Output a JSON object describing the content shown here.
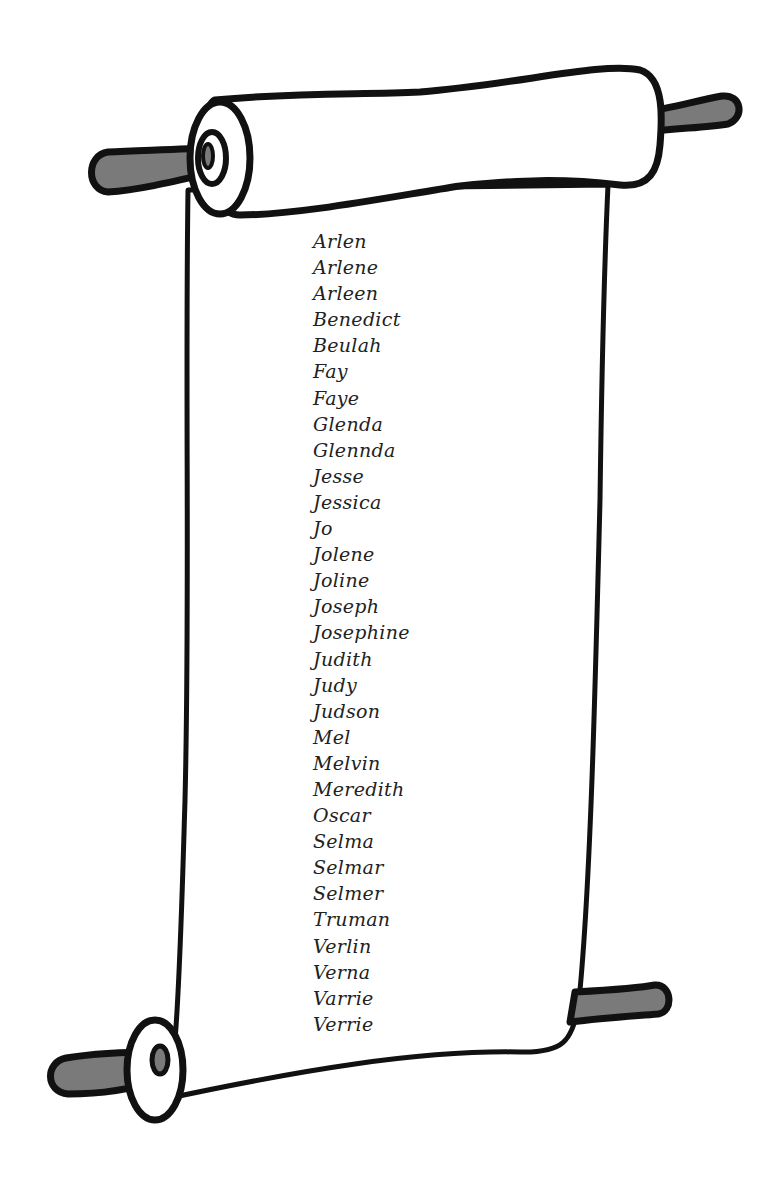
{
  "scroll": {
    "outline_color": "#111111",
    "paper_color": "#ffffff",
    "handle_color": "#7a7a7a",
    "names": [
      "Arlen",
      "Arlene",
      "Arleen",
      "Benedict",
      "Beulah",
      "Fay",
      "Faye",
      "Glenda",
      "Glennda",
      "Jesse",
      "Jessica",
      "Jo",
      "Jolene",
      "Joline",
      "Joseph",
      "Josephine",
      "Judith",
      "Judy",
      "Judson",
      "Mel",
      "Melvin",
      "Meredith",
      "Oscar",
      "Selma",
      "Selmar",
      "Selmer",
      "Truman",
      "Verlin",
      "Verna",
      "Varrie",
      "Verrie"
    ]
  }
}
